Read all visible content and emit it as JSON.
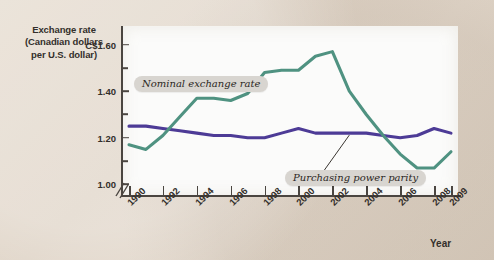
{
  "figure": {
    "background_color": "#ded3c6",
    "plot_background": "#fbfbfa"
  },
  "chart_data": {
    "type": "line",
    "title": "",
    "ylabel": "Exchange rate (Canadian dollars per U.S. dollar)",
    "ylabel_lines": [
      "Exchange rate",
      "(Canadian dollars",
      "per U.S. dollar)"
    ],
    "xlabel": "Year",
    "ylim": [
      0.95,
      1.68
    ],
    "y_ticks": [
      1.0,
      1.2,
      1.4,
      1.6
    ],
    "y_tick_labels": [
      "1.00",
      "1.20",
      "1.40",
      "C$1.60"
    ],
    "y_minor_ticks": [
      1.1,
      1.3,
      1.5
    ],
    "axis_break": true,
    "grid": false,
    "legend_position": "inline-callouts",
    "x": [
      1990,
      1991,
      1992,
      1993,
      1994,
      1995,
      1996,
      1997,
      1998,
      1999,
      2000,
      2001,
      2002,
      2003,
      2004,
      2005,
      2006,
      2007,
      2008,
      2009
    ],
    "x_ticks": [
      1990,
      1992,
      1994,
      1996,
      1998,
      2000,
      2002,
      2004,
      2006,
      2008,
      2009
    ],
    "x_tick_labels": [
      "1990",
      "1992",
      "1994",
      "1996",
      "1998",
      "2000",
      "2002",
      "2004",
      "2006",
      "2008",
      "2009"
    ],
    "series": [
      {
        "name": "Nominal exchange rate",
        "color": "#4f9281",
        "values": [
          1.17,
          1.15,
          1.21,
          1.29,
          1.37,
          1.37,
          1.36,
          1.39,
          1.48,
          1.49,
          1.49,
          1.55,
          1.57,
          1.4,
          1.3,
          1.21,
          1.13,
          1.07,
          1.07,
          1.14
        ]
      },
      {
        "name": "Purchasing power parity",
        "color": "#4d3b96",
        "values": [
          1.25,
          1.25,
          1.24,
          1.23,
          1.22,
          1.21,
          1.21,
          1.2,
          1.2,
          1.22,
          1.24,
          1.22,
          1.22,
          1.22,
          1.22,
          1.21,
          1.2,
          1.21,
          1.24,
          1.22
        ]
      }
    ],
    "annotations": [
      {
        "label": "Nominal exchange rate",
        "points_to_series": "Nominal exchange rate",
        "points_to_x": 1997
      },
      {
        "label": "Purchasing power parity",
        "points_to_series": "Purchasing power parity",
        "points_to_x": 2003
      }
    ]
  }
}
